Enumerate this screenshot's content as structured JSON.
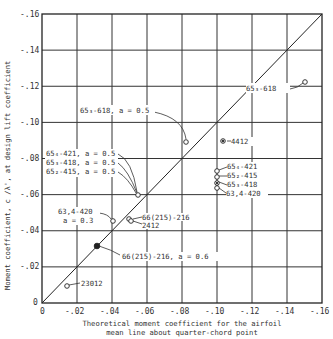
{
  "chart_data": {
    "type": "scatter",
    "title": "",
    "xlabel": "Theoretical moment coefficient for the airfoil mean line about quarter-chord point",
    "xlabel_lines": [
      "Theoretical moment coefficient for the airfoil",
      "mean line about quarter-chord point"
    ],
    "ylabel": "Moment coefficient, c_m0/λ', at design lift coefficient",
    "xlim": [
      0,
      -0.16
    ],
    "ylim": [
      0,
      -0.16
    ],
    "grid": true,
    "x_ticks": [
      "0",
      "-.02",
      "-.04",
      "-.06",
      "-.08",
      "-.10",
      "-.12",
      "-.14",
      "-.16"
    ],
    "y_ticks": [
      "0",
      "-.02",
      "-.04",
      "-.06",
      "-.08",
      "-.10",
      "-.12",
      "-.14",
      "-.16"
    ],
    "reference_line": {
      "from": [
        0,
        0
      ],
      "to": [
        -0.16,
        -0.16
      ],
      "label": "line of equality"
    },
    "points": [
      {
        "label": "65₃-618",
        "x": -0.148,
        "y": -0.122,
        "marker": "open-circle"
      },
      {
        "label": "65₃-618, a = 0.5",
        "x": -0.082,
        "y": -0.089,
        "marker": "open-circle"
      },
      {
        "label": "4412",
        "x": -0.103,
        "y": -0.09,
        "marker": "circle-dot"
      },
      {
        "label": "65₄-421",
        "x": -0.1,
        "y": -0.073,
        "marker": "open-circle"
      },
      {
        "label": "65₂-415",
        "x": -0.1,
        "y": -0.07,
        "marker": "open-circle"
      },
      {
        "label": "65₃-418",
        "x": -0.1,
        "y": -0.066,
        "marker": "circle-cross"
      },
      {
        "label": "63,4-420",
        "x": -0.1,
        "y": -0.064,
        "marker": "open-circle"
      },
      {
        "label": "65₄-421, a = 0.5 / 65₃-418, a = 0.5 / 65₂-415, a = 0.5",
        "x": -0.055,
        "y": -0.06,
        "marker": "open-circle"
      },
      {
        "label": "63,4-420, a = 0.3",
        "x": -0.041,
        "y": -0.045,
        "marker": "open-circle"
      },
      {
        "label": "66(215)-216",
        "x": -0.05,
        "y": -0.047,
        "marker": "open-circle"
      },
      {
        "label": "2412",
        "x": -0.051,
        "y": -0.046,
        "marker": "open-circle"
      },
      {
        "label": "66(215)-216, a = 0.6",
        "x": -0.031,
        "y": -0.031,
        "marker": "filled-circle"
      },
      {
        "label": "23012",
        "x": -0.014,
        "y": -0.01,
        "marker": "open-circle"
      }
    ]
  },
  "annotations": {
    "a1": "65₃-618",
    "a2": "65₃-618, a = 0.5",
    "a3": "4412",
    "a4": "65₄-421",
    "a5": "65₂-415",
    "a6": "65₃-418",
    "a7": "63,4-420",
    "a8a": "65₄-421, a = 0.5",
    "a8b": "65₃-418, a = 0.5",
    "a8c": "65₂-415, a = 0.5",
    "a9a": "63,4-420",
    "a9b": "a = 0.3",
    "a10": "66(215)-216",
    "a11": "2412",
    "a12": "66(215)-216, a = 0.6",
    "a13": "23012"
  },
  "axes": {
    "x_title_1": "Theoretical moment coefficient for the airfoil",
    "x_title_2": "mean line about quarter-chord point",
    "y_title": "Moment coefficient, c  /λ', at design lift coefficient",
    "y_title_sub": "m0",
    "x_ticks": [
      "0",
      "-.02",
      "-.04",
      "-.06",
      "-.08",
      "-.10",
      "-.12",
      "-.14",
      "-.16"
    ],
    "y_ticks": [
      "0",
      "-.02",
      "-.04",
      "-.06",
      "-.08",
      "-.10",
      "-.12",
      "-.14",
      "-.16"
    ]
  },
  "colors": {
    "ink": "#2a2a2a",
    "grid": "#333333",
    "background": "#ffffff"
  }
}
